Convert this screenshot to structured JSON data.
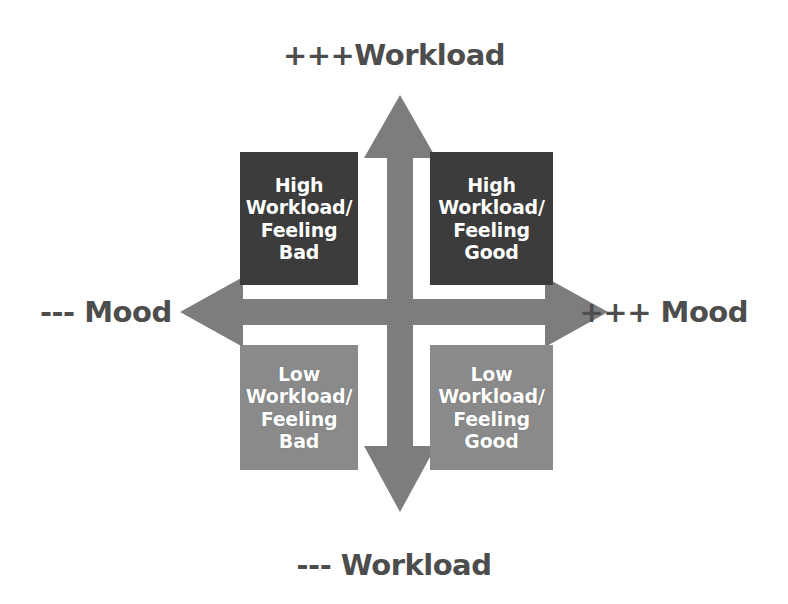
{
  "diagram": {
    "type": "2x2-quadrant-matrix",
    "axes": {
      "vertical": {
        "name": "Workload",
        "positive_label": "+++Workload",
        "negative_label": "--- Workload",
        "arrow_color": "#7d7d7d",
        "label_color": "#4d4d4d"
      },
      "horizontal": {
        "name": "Mood",
        "positive_label": "+++ Mood",
        "negative_label": "--- Mood",
        "arrow_color": "#7d7d7d",
        "label_color": "#4d4d4d"
      }
    },
    "quadrants": [
      {
        "id": "high-bad",
        "position": "top-left",
        "lines": [
          "High",
          "Workload/",
          "Feeling Bad"
        ],
        "text": "High Workload/ Feeling Bad",
        "fill": "#3c3c3c",
        "text_color": "#ffffff"
      },
      {
        "id": "high-good",
        "position": "top-right",
        "lines": [
          "High",
          "Workload/",
          "Feeling Good"
        ],
        "text": "High Workload/ Feeling Good",
        "fill": "#3c3c3c",
        "text_color": "#ffffff"
      },
      {
        "id": "low-bad",
        "position": "bottom-left",
        "lines": [
          "Low",
          "Workload/",
          "Feeling Bad"
        ],
        "text": "Low Workload/ Feeling Bad",
        "fill": "#8a8a8a",
        "text_color": "#ffffff"
      },
      {
        "id": "low-good",
        "position": "bottom-right",
        "lines": [
          "Low",
          "Workload/",
          "Feeling Good"
        ],
        "text": "Low Workload/ Feeling Good",
        "fill": "#8a8a8a",
        "text_color": "#ffffff"
      }
    ],
    "background": "#ffffff"
  }
}
